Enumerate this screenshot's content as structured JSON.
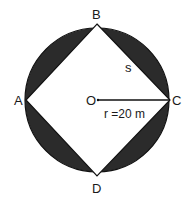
{
  "diagram": {
    "type": "square inscribed in circle",
    "circle": {
      "cx": 97,
      "cy": 101,
      "r": 72
    },
    "vertices": {
      "A": {
        "label": "A",
        "x": 27,
        "y": 101
      },
      "B": {
        "label": "B",
        "x": 97,
        "y": 24
      },
      "C": {
        "label": "C",
        "x": 170,
        "y": 101
      },
      "D": {
        "label": "D",
        "x": 97,
        "y": 176
      }
    },
    "center_label": "O",
    "side_label": "s",
    "radius_label": "r =20 m",
    "colors": {
      "shaded": "#2b2b2b",
      "outline": "#111111",
      "square_fill": "#ffffff"
    }
  }
}
